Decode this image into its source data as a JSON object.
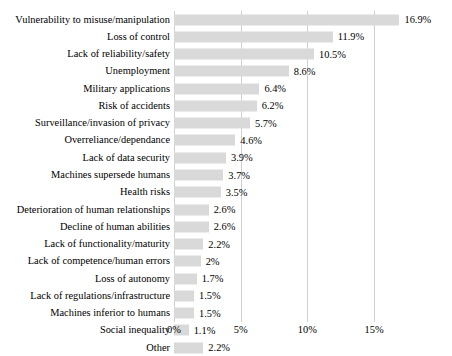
{
  "chart_data": {
    "type": "bar",
    "orientation": "horizontal",
    "title": "",
    "subtitle": "",
    "xlabel": "",
    "ylabel": "",
    "xlim": [
      0,
      15.4
    ],
    "grid": true,
    "legend": false,
    "bar_color": "#d9d9d9",
    "gridline_color": "#d0d0d0",
    "xticks": [
      "0%",
      "5%",
      "10%",
      "15%"
    ],
    "xtick_values": [
      0,
      5,
      10,
      15
    ],
    "categories": [
      "Vulnerability to misuse/manipulation",
      "Loss of control",
      "Lack of reliability/safety",
      "Unemployment",
      "Military applications",
      "Risk of accidents",
      "Surveillance/invasion of privacy",
      "Overreliance/dependance",
      "Lack of data security",
      "Machines supersede humans",
      "Health risks",
      "Deterioration of human relationships",
      "Decline of human abilities",
      "Lack of functionality/maturity",
      "Lack of competence/human errors",
      "Loss of autonomy",
      "Lack of regulations/infrastructure",
      "Machines inferior to humans",
      "Social inequality",
      "Other"
    ],
    "values": [
      16.9,
      11.9,
      10.5,
      8.6,
      6.4,
      6.2,
      5.7,
      4.6,
      3.9,
      3.7,
      3.5,
      2.6,
      2.6,
      2.2,
      2.0,
      1.7,
      1.5,
      1.5,
      1.1,
      2.2
    ],
    "data_labels": [
      "16.9%",
      "11.9%",
      "10.5%",
      "8.6%",
      "6.4%",
      "6.2%",
      "5.7%",
      "4.6%",
      "3.9%",
      "3.7%",
      "3.5%",
      "2.6%",
      "2.6%",
      "2.2%",
      "2%",
      "1.7%",
      "1.5%",
      "1.5%",
      "1.1%",
      "2.2%"
    ]
  }
}
